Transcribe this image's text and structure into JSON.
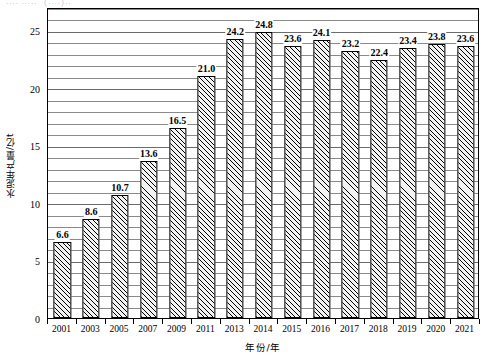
{
  "caption_remnant": "···· ····· （····）··",
  "chart_data": {
    "type": "bar",
    "title": "",
    "xlabel": "年份/年",
    "ylabel": "水泥年产量/亿t",
    "categories": [
      "2001",
      "2003",
      "2005",
      "2007",
      "2009",
      "2011",
      "2013",
      "2014",
      "2015",
      "2016",
      "2017",
      "2018",
      "2019",
      "2020",
      "2021"
    ],
    "values": [
      6.6,
      8.6,
      10.7,
      13.6,
      16.5,
      21.0,
      24.2,
      24.8,
      23.6,
      24.1,
      23.2,
      22.4,
      23.4,
      23.8,
      23.6
    ],
    "value_labels": [
      "6.6",
      "8.6",
      "10.7",
      "13.6",
      "16.5",
      "21.0",
      "24.2",
      "24.8",
      "23.6",
      "24.1",
      "23.2",
      "22.4",
      "23.4",
      "23.8",
      "23.6"
    ],
    "ylim": [
      0,
      27
    ],
    "y_major_ticks": [
      0,
      5,
      10,
      15,
      20,
      25
    ],
    "y_major_tick_labels": [
      "0",
      "5",
      "10",
      "15",
      "20",
      "25"
    ],
    "y_minor_tick_step": 1,
    "grid": "horizontal",
    "legend": "none",
    "bar_fill": "diagonal-hatch",
    "bar_edge_color": "#000000",
    "gridline_color": "#8a8a8a"
  }
}
